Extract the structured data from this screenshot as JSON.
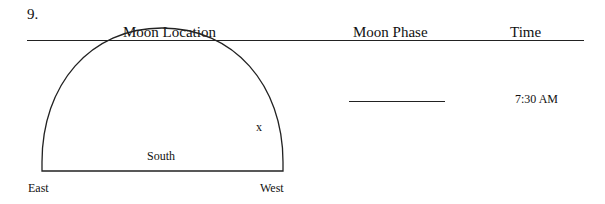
{
  "question": {
    "number": "9."
  },
  "headers": {
    "location": "Moon Location",
    "phase": "Moon Phase",
    "time": "Time"
  },
  "diagram": {
    "marker": "x",
    "south_label": "South",
    "east_label": "East",
    "west_label": "West"
  },
  "phase_answer": {
    "value": ""
  },
  "time_value": "7:30 AM"
}
